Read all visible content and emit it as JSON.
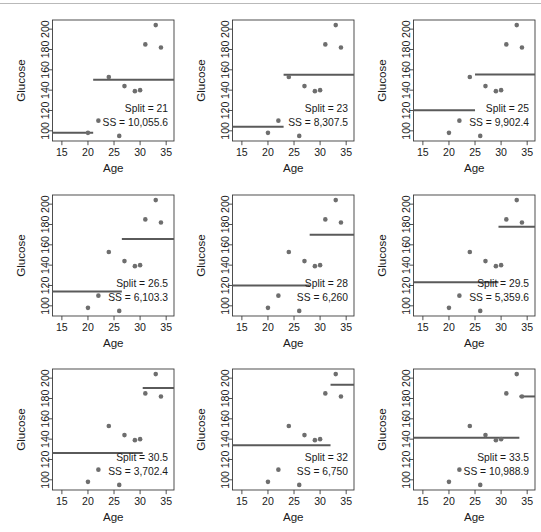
{
  "figure": {
    "type": "small-multiples-scatter",
    "panel_count": 9,
    "axis_x_label": "Age",
    "axis_y_label": "Glucose",
    "x_ticks": [
      15,
      20,
      25,
      30,
      35
    ],
    "y_ticks": [
      100,
      120,
      140,
      160,
      180,
      200
    ],
    "xlim": [
      13.2,
      36.5
    ],
    "ylim": [
      90,
      209
    ],
    "point_color": "#6e6e6e",
    "line_color": "#5a5a5a",
    "axis_color": "#3c3c3c",
    "text_color": "#1a1a1a",
    "split_label": "Split = ",
    "ss_label": "SS = "
  },
  "chart_data": {
    "type": "scatter",
    "title": "",
    "xlabel": "Age",
    "ylabel": "Glucose",
    "xlim": [
      13.2,
      36.5
    ],
    "ylim": [
      90,
      209
    ],
    "xticks": [
      15,
      20,
      25,
      30,
      35
    ],
    "yticks": [
      100,
      120,
      140,
      160,
      180,
      200
    ],
    "grid": false,
    "legend": "none",
    "points": [
      {
        "x": 20,
        "y": 98
      },
      {
        "x": 22,
        "y": 110
      },
      {
        "x": 24,
        "y": 153
      },
      {
        "x": 26,
        "y": 95
      },
      {
        "x": 27,
        "y": 144
      },
      {
        "x": 29,
        "y": 139
      },
      {
        "x": 30,
        "y": 140
      },
      {
        "x": 31,
        "y": 185
      },
      {
        "x": 33,
        "y": 204
      },
      {
        "x": 34,
        "y": 182
      }
    ],
    "panels": [
      {
        "index": 1,
        "split": 21,
        "split_text": "21",
        "ss": 10055.6,
        "ss_text": "10,055.6",
        "left_mean": 98,
        "right_mean": 150.2,
        "left_segment": [
          13.2,
          21
        ],
        "right_segment": [
          21,
          36.5
        ]
      },
      {
        "index": 2,
        "split": 23,
        "split_text": "23",
        "ss": 8307.5,
        "ss_text": "8,307.5",
        "left_mean": 104,
        "right_mean": 155.25,
        "left_segment": [
          13.2,
          23
        ],
        "right_segment": [
          23,
          36.5
        ]
      },
      {
        "index": 3,
        "split": 25,
        "split_text": "25",
        "ss": 9902.4,
        "ss_text": "9,902.4",
        "left_mean": 120.3,
        "right_mean": 155.3,
        "left_segment": [
          13.2,
          25
        ],
        "right_segment": [
          25,
          36.5
        ]
      },
      {
        "index": 4,
        "split": 26.5,
        "split_text": "26.5",
        "ss": 6103.3,
        "ss_text": "6,103.3",
        "left_mean": 114,
        "right_mean": 165.7,
        "left_segment": [
          13.2,
          26.5
        ],
        "right_segment": [
          26.5,
          36.5
        ]
      },
      {
        "index": 5,
        "split": 28,
        "split_text": "28",
        "ss": 6260,
        "ss_text": "6,260",
        "left_mean": 120,
        "right_mean": 170,
        "left_segment": [
          13.2,
          28
        ],
        "right_segment": [
          28,
          36.5
        ]
      },
      {
        "index": 6,
        "split": 29.5,
        "split_text": "29.5",
        "ss": 5359.6,
        "ss_text": "5,359.6",
        "left_mean": 123.2,
        "right_mean": 177.7,
        "left_segment": [
          13.2,
          29.5
        ],
        "right_segment": [
          29.5,
          36.5
        ]
      },
      {
        "index": 7,
        "split": 30.5,
        "split_text": "30.5",
        "ss": 3702.4,
        "ss_text": "3,702.4",
        "left_mean": 126.4,
        "right_mean": 190.3,
        "left_segment": [
          13.2,
          30.5
        ],
        "right_segment": [
          30.5,
          36.5
        ]
      },
      {
        "index": 8,
        "split": 32,
        "split_text": "32",
        "ss": 6750,
        "ss_text": "6,750",
        "left_mean": 134,
        "right_mean": 193.5,
        "left_segment": [
          13.2,
          32
        ],
        "right_segment": [
          32,
          36.5
        ]
      },
      {
        "index": 9,
        "split": 33.5,
        "split_text": "33.5",
        "ss": 10988.9,
        "ss_text": "10,988.9",
        "left_mean": 141.3,
        "right_mean": 182,
        "left_segment": [
          13.2,
          33.5
        ],
        "right_segment": [
          33.5,
          36.5
        ]
      }
    ]
  }
}
